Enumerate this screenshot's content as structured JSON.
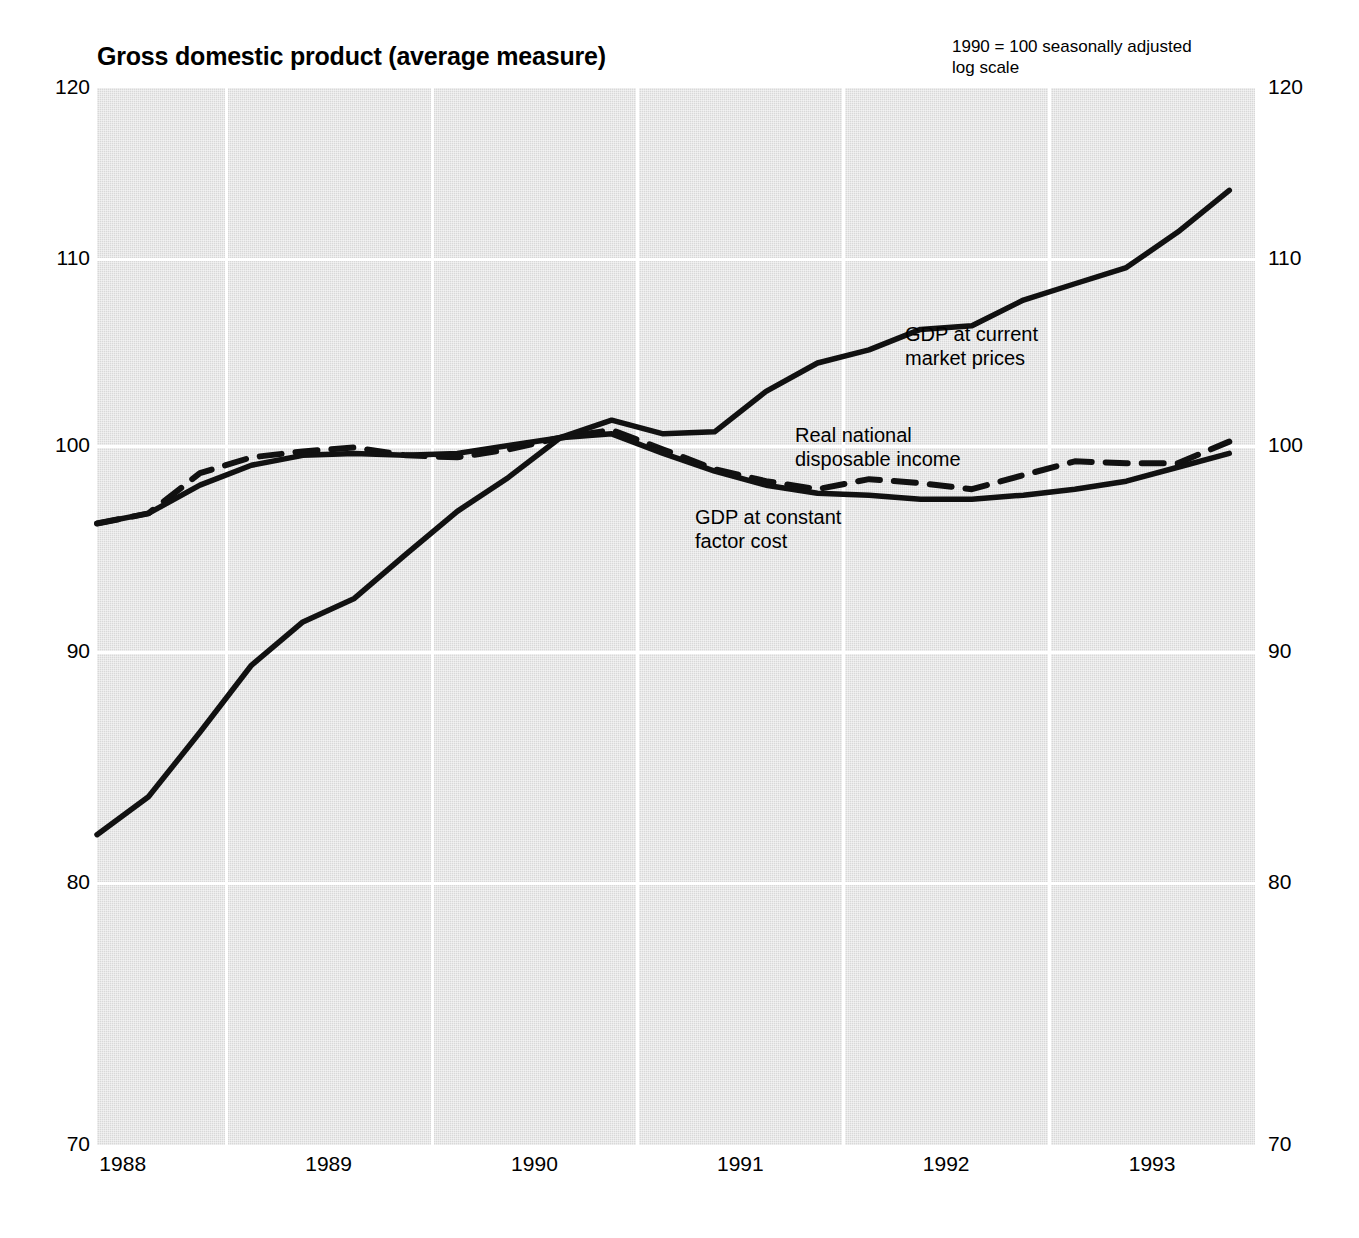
{
  "header": {
    "title": "Gross domestic product (average measure)",
    "note_line1": "1990 = 100 seasonally adjusted",
    "note_line2": "log scale"
  },
  "axes": {
    "y_ticks": [
      "120",
      "110",
      "100",
      "90",
      "80",
      "70"
    ],
    "x_ticks": [
      "1988",
      "1989",
      "1990",
      "1991",
      "1992",
      "1993"
    ]
  },
  "annotations": {
    "current_line1": "GDP at current",
    "current_line2": "market prices",
    "rndi_line1": "Real national",
    "rndi_line2": "disposable income",
    "constant_line1": "GDP at constant",
    "constant_line2": "factor cost"
  },
  "chart_data": {
    "type": "line",
    "title": "Gross domestic product (average measure)",
    "subtitle": "1990 = 100 seasonally adjusted, log scale",
    "xlabel": "",
    "ylabel": "",
    "ylim": [
      70,
      120
    ],
    "yscale": "log",
    "y_ticks": [
      120,
      110,
      100,
      90,
      80,
      70
    ],
    "x_ticks": [
      1988,
      1989,
      1990,
      1991,
      1992,
      1993
    ],
    "xlim": [
      1987.875,
      1993.5
    ],
    "grid": true,
    "grid_x_positions": [
      1988.5,
      1989.5,
      1990.5,
      1991.5,
      1992.5
    ],
    "legend": "inline annotations",
    "x": [
      1987.875,
      1988.125,
      1988.375,
      1988.625,
      1988.875,
      1989.125,
      1989.375,
      1989.625,
      1989.875,
      1990.125,
      1990.375,
      1990.625,
      1990.875,
      1991.125,
      1991.375,
      1991.625,
      1991.875,
      1992.125,
      1992.375,
      1992.625,
      1992.875,
      1993.125,
      1993.375
    ],
    "series": [
      {
        "name": "GDP at current market prices",
        "style": "solid",
        "color": "#111111",
        "values": [
          82.0,
          83.6,
          86.4,
          89.4,
          91.4,
          92.5,
          94.6,
          96.7,
          98.4,
          100.4,
          101.3,
          100.6,
          100.7,
          102.8,
          104.3,
          105.0,
          106.1,
          106.3,
          107.7,
          108.6,
          109.5,
          111.5,
          113.9
        ]
      },
      {
        "name": "Real national disposable income",
        "style": "dashed",
        "color": "#111111",
        "values": [
          96.1,
          96.6,
          98.6,
          99.4,
          99.7,
          99.9,
          99.5,
          99.4,
          99.8,
          100.4,
          100.8,
          99.8,
          98.8,
          98.2,
          97.8,
          98.3,
          98.1,
          97.8,
          98.5,
          99.2,
          99.1,
          99.1,
          100.2
        ]
      },
      {
        "name": "GDP at constant factor cost",
        "style": "solid",
        "color": "#111111",
        "values": [
          96.1,
          96.6,
          98.0,
          99.0,
          99.5,
          99.6,
          99.5,
          99.6,
          100.0,
          100.4,
          100.6,
          99.6,
          98.7,
          98.0,
          97.6,
          97.5,
          97.3,
          97.3,
          97.5,
          97.8,
          98.2,
          98.9,
          99.6
        ]
      }
    ]
  }
}
